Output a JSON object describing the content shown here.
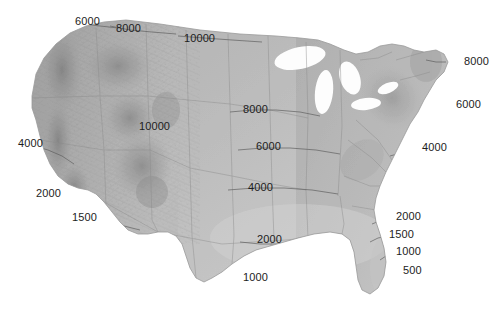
{
  "figure": {
    "name": "us-elevation-contour-map",
    "background_color": "#ffffff",
    "width": 503,
    "height": 318,
    "label_color": "#1d1d1d",
    "units_implied": "feet"
  },
  "chart_data": {
    "type": "map",
    "title": "",
    "subtitle": "",
    "xlabel": "",
    "ylabel": "",
    "grid": false,
    "legend": "none",
    "contour_levels": [
      500,
      1000,
      1500,
      2000,
      4000,
      6000,
      8000,
      10000
    ],
    "labels": [
      {
        "id": "lbl-6000-nw-top",
        "text": "6000",
        "value": 6000,
        "x": 75,
        "y": 16
      },
      {
        "id": "lbl-8000-n-top",
        "text": "8000",
        "value": 8000,
        "x": 116,
        "y": 23
      },
      {
        "id": "lbl-10000-n-top",
        "text": "10000",
        "value": 10000,
        "x": 184,
        "y": 33
      },
      {
        "id": "lbl-8000-ne-right",
        "text": "8000",
        "value": 8000,
        "x": 464,
        "y": 56
      },
      {
        "id": "lbl-8000-central",
        "text": "8000",
        "value": 8000,
        "x": 243,
        "y": 104
      },
      {
        "id": "lbl-6000-ne-right",
        "text": "6000",
        "value": 6000,
        "x": 456,
        "y": 99
      },
      {
        "id": "lbl-10000-rockies",
        "text": "10000",
        "value": 10000,
        "x": 139,
        "y": 121
      },
      {
        "id": "lbl-6000-central",
        "text": "6000",
        "value": 6000,
        "x": 256,
        "y": 141
      },
      {
        "id": "lbl-4000-w-left",
        "text": "4000",
        "value": 4000,
        "x": 18,
        "y": 138
      },
      {
        "id": "lbl-4000-e-right",
        "text": "4000",
        "value": 4000,
        "x": 422,
        "y": 142
      },
      {
        "id": "lbl-4000-central",
        "text": "4000",
        "value": 4000,
        "x": 248,
        "y": 182
      },
      {
        "id": "lbl-2000-w-left",
        "text": "2000",
        "value": 2000,
        "x": 36,
        "y": 188
      },
      {
        "id": "lbl-2000-se-right",
        "text": "2000",
        "value": 2000,
        "x": 396,
        "y": 211
      },
      {
        "id": "lbl-1500-w-left",
        "text": "1500",
        "value": 1500,
        "x": 72,
        "y": 212
      },
      {
        "id": "lbl-1500-se-right",
        "text": "1500",
        "value": 1500,
        "x": 389,
        "y": 229
      },
      {
        "id": "lbl-2000-gulf",
        "text": "2000",
        "value": 2000,
        "x": 257,
        "y": 234
      },
      {
        "id": "lbl-1000-se-right",
        "text": "1000",
        "value": 1000,
        "x": 396,
        "y": 246
      },
      {
        "id": "lbl-500-florida",
        "text": "500",
        "value": 500,
        "x": 403,
        "y": 265
      },
      {
        "id": "lbl-1000-gulf",
        "text": "1000",
        "value": 1000,
        "x": 243,
        "y": 272
      }
    ]
  }
}
